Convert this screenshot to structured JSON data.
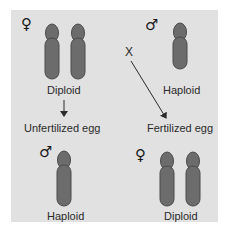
{
  "diagram": {
    "colors": {
      "panel_background": "#e1e1e1",
      "chromosome_fill": "#6c6c6c",
      "chromosome_outline": "#4a4a4a",
      "text": "#2a2a2a"
    },
    "top_left": {
      "sex_symbol": "♀",
      "sex": "female",
      "chromosome_count": 2,
      "label": "Diploid"
    },
    "top_right": {
      "sex_symbol": "♂",
      "sex": "male",
      "chromosome_count": 1,
      "label": "Haploid"
    },
    "cross_marker": "X",
    "left_arrow_target": "Unfertilized egg",
    "right_arrow_target": "Fertilized egg",
    "bottom_left": {
      "sex_symbol": "♂",
      "sex": "male",
      "chromosome_count": 1,
      "label": "Haploid"
    },
    "bottom_right": {
      "sex_symbol": "♀",
      "sex": "female",
      "chromosome_count": 2,
      "label": "Diploid"
    }
  }
}
